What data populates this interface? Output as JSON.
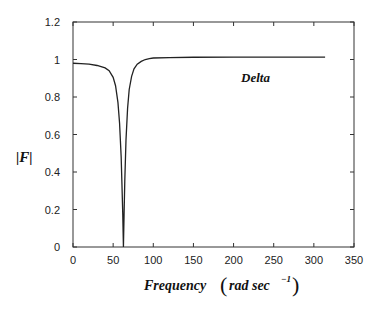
{
  "chart_data": {
    "type": "line",
    "title": "",
    "xlabel": "Frequency (rad sec^-1)",
    "ylabel": "|F|",
    "xlim": [
      0,
      350
    ],
    "ylim": [
      0,
      1.2
    ],
    "xticks": [
      0,
      50,
      100,
      150,
      200,
      250,
      300,
      350
    ],
    "yticks": [
      0,
      0.2,
      0.4,
      0.6,
      0.8,
      1,
      1.2
    ],
    "grid": false,
    "legend": null,
    "annotations": [
      {
        "text": "Delta",
        "x": 210,
        "y": 0.93
      }
    ],
    "series": [
      {
        "name": "Delta",
        "color": "#222222",
        "x": [
          0,
          10,
          20,
          30,
          40,
          45,
          50,
          53,
          56,
          58,
          60,
          61,
          62,
          62.8,
          63.6,
          64.5,
          66,
          68,
          70,
          73,
          76,
          80,
          85,
          90,
          95,
          100,
          120,
          150,
          200,
          250,
          300,
          314
        ],
        "y": [
          0.98,
          0.978,
          0.975,
          0.968,
          0.955,
          0.94,
          0.905,
          0.86,
          0.77,
          0.66,
          0.48,
          0.33,
          0.17,
          0.0,
          0.17,
          0.35,
          0.57,
          0.74,
          0.84,
          0.91,
          0.95,
          0.975,
          0.99,
          1.0,
          1.005,
          1.008,
          1.01,
          1.012,
          1.013,
          1.013,
          1.013,
          1.013
        ]
      }
    ]
  },
  "labels": {
    "ylabel": "|F|",
    "xlabel_main": "Frequency",
    "xlabel_unit": "rad sec",
    "xlabel_exp": "−1",
    "annotation": "Delta",
    "xticks": [
      "0",
      "50",
      "100",
      "150",
      "200",
      "250",
      "300",
      "350"
    ],
    "yticks": [
      "0",
      "0.2",
      "0.4",
      "0.6",
      "0.8",
      "1",
      "1.2"
    ]
  }
}
